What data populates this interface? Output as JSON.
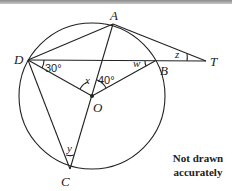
{
  "diagram": {
    "points": {
      "A": {
        "label": "A",
        "x": 113,
        "y": 24
      },
      "B": {
        "label": "B",
        "x": 155,
        "y": 61
      },
      "C": {
        "label": "C",
        "x": 70,
        "y": 169
      },
      "D": {
        "label": "D",
        "x": 28,
        "y": 60
      },
      "O": {
        "label": "O",
        "x": 92,
        "y": 96
      },
      "T": {
        "label": "T",
        "x": 206,
        "y": 61
      }
    },
    "circle": {
      "center": "O",
      "radius": 73
    },
    "segments": [
      "DA",
      "AT",
      "DT",
      "DO",
      "OB",
      "AC",
      "DC",
      "OC"
    ],
    "angles": {
      "ODB": "30°",
      "AOB": "40°",
      "DOA": "x",
      "OBD": "w",
      "ATD": "z",
      "DCO": "y"
    },
    "note_line1": "Not drawn",
    "note_line2": "accurately"
  }
}
